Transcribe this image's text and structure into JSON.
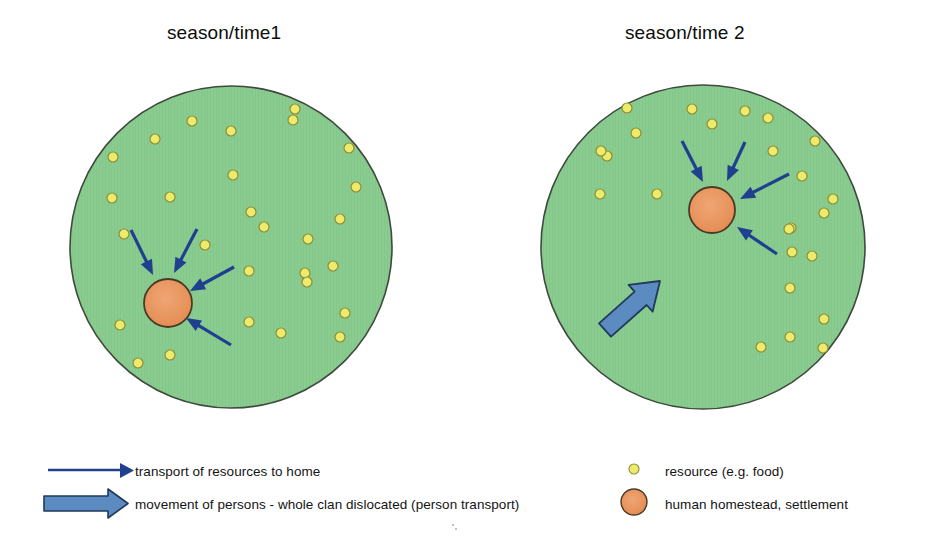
{
  "diagram": {
    "panels": [
      {
        "id": "season-time-1",
        "title": "season/time1",
        "territory": {
          "cx": 231,
          "cy": 247,
          "r": 161,
          "fill": "#8ACB8F",
          "stroke": "#3f4a3f"
        },
        "settlement": {
          "cx": 168,
          "cy": 303,
          "r": 24,
          "fill": "#E8935C",
          "stroke": "#4a3b28",
          "label": "human homestead, settlement"
        },
        "resources": [
          {
            "x": 113,
            "y": 157
          },
          {
            "x": 155,
            "y": 139
          },
          {
            "x": 192,
            "y": 121
          },
          {
            "x": 231,
            "y": 131
          },
          {
            "x": 233,
            "y": 175
          },
          {
            "x": 293,
            "y": 120
          },
          {
            "x": 295,
            "y": 109
          },
          {
            "x": 349,
            "y": 148
          },
          {
            "x": 356,
            "y": 187
          },
          {
            "x": 112,
            "y": 198
          },
          {
            "x": 170,
            "y": 197
          },
          {
            "x": 251,
            "y": 212
          },
          {
            "x": 264,
            "y": 227
          },
          {
            "x": 340,
            "y": 219
          },
          {
            "x": 124,
            "y": 234
          },
          {
            "x": 205,
            "y": 245
          },
          {
            "x": 308,
            "y": 239
          },
          {
            "x": 249,
            "y": 271
          },
          {
            "x": 333,
            "y": 266
          },
          {
            "x": 305,
            "y": 273
          },
          {
            "x": 307,
            "y": 282
          },
          {
            "x": 120,
            "y": 325
          },
          {
            "x": 170,
            "y": 355
          },
          {
            "x": 138,
            "y": 363
          },
          {
            "x": 249,
            "y": 322
          },
          {
            "x": 281,
            "y": 333
          },
          {
            "x": 345,
            "y": 313
          },
          {
            "x": 340,
            "y": 337
          }
        ],
        "resource_style": {
          "r": 5.0,
          "fill": "#EDEB6E",
          "stroke": "#8e8f33"
        },
        "transport_arrows": [
          {
            "x1": 131,
            "y1": 230,
            "x2": 153,
            "y2": 275
          },
          {
            "x1": 197,
            "y1": 229,
            "x2": 174,
            "y2": 273
          },
          {
            "x1": 234,
            "y1": 267,
            "x2": 190,
            "y2": 291
          },
          {
            "x1": 231,
            "y1": 345,
            "x2": 186,
            "y2": 318
          }
        ],
        "arrow_style": {
          "color": "#1F3F8F",
          "width": 3.2
        }
      },
      {
        "id": "season-time-2",
        "title": "season/time 2",
        "territory": {
          "cx": 703,
          "cy": 247,
          "r": 162,
          "fill": "#8ACB8F",
          "stroke": "#3f4a3f"
        },
        "settlement": {
          "cx": 712,
          "cy": 210,
          "r": 23,
          "fill": "#E8935C",
          "stroke": "#4a3b28",
          "label": "human homestead, settlement"
        },
        "resources": [
          {
            "x": 627,
            "y": 108
          },
          {
            "x": 692,
            "y": 109
          },
          {
            "x": 745,
            "y": 111
          },
          {
            "x": 712,
            "y": 124
          },
          {
            "x": 768,
            "y": 118
          },
          {
            "x": 636,
            "y": 133
          },
          {
            "x": 607,
            "y": 156
          },
          {
            "x": 601,
            "y": 151
          },
          {
            "x": 815,
            "y": 141
          },
          {
            "x": 773,
            "y": 151
          },
          {
            "x": 802,
            "y": 176
          },
          {
            "x": 600,
            "y": 194
          },
          {
            "x": 657,
            "y": 194
          },
          {
            "x": 833,
            "y": 199
          },
          {
            "x": 824,
            "y": 213
          },
          {
            "x": 791,
            "y": 228
          },
          {
            "x": 789,
            "y": 229
          },
          {
            "x": 792,
            "y": 252
          },
          {
            "x": 812,
            "y": 256
          },
          {
            "x": 790,
            "y": 288
          },
          {
            "x": 824,
            "y": 319
          },
          {
            "x": 790,
            "y": 337
          },
          {
            "x": 761,
            "y": 347
          },
          {
            "x": 823,
            "y": 348
          }
        ],
        "resource_style": {
          "r": 5.0,
          "fill": "#EDEB6E",
          "stroke": "#8e8f33"
        },
        "transport_arrows": [
          {
            "x1": 682,
            "y1": 141,
            "x2": 703,
            "y2": 182
          },
          {
            "x1": 745,
            "y1": 142,
            "x2": 727,
            "y2": 181
          },
          {
            "x1": 789,
            "y1": 174,
            "x2": 740,
            "y2": 199
          },
          {
            "x1": 777,
            "y1": 254,
            "x2": 737,
            "y2": 227
          }
        ],
        "arrow_style": {
          "color": "#1F3F8F",
          "width": 3.2
        },
        "migration_arrow": {
          "x1": 605,
          "y1": 330,
          "x2": 660,
          "y2": 281,
          "fill": "#5B8BC0",
          "stroke": "#203a5c",
          "label": "movement of persons - whole clan dislocated (person transport)"
        }
      }
    ]
  },
  "legend": {
    "items": [
      {
        "icon": "thin-arrow-icon",
        "label": "transport of resources to home",
        "color": "#1F3F8F"
      },
      {
        "icon": "block-arrow-icon",
        "label": "movement of persons - whole clan dislocated (person transport)",
        "color": "#5B8BC0"
      },
      {
        "icon": "resource-dot-icon",
        "label": "resource (e.g. food)",
        "color": "#EDEB6E"
      },
      {
        "icon": "settlement-circle-icon",
        "label": "human homestead, settlement",
        "color": "#E8935C"
      }
    ]
  }
}
